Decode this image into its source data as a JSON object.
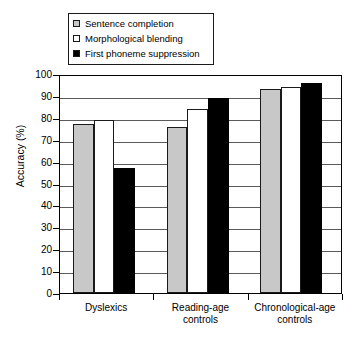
{
  "chart_data": {
    "type": "bar",
    "title": "",
    "xlabel": "",
    "ylabel": "Accuracy (%)",
    "ylim": [
      0,
      100
    ],
    "ytick_step": 10,
    "yticks": [
      "100",
      "90",
      "80",
      "70",
      "60",
      "50",
      "40",
      "30",
      "20",
      "10",
      "0"
    ],
    "grid": "horizontal",
    "legend_position": "above-plot-left",
    "categories": [
      "Dyslexics",
      "Reading-age controls",
      "Chronological-age controls"
    ],
    "category_lines": [
      [
        "Dyslexics"
      ],
      [
        "Reading-age",
        "controls"
      ],
      [
        "Chronological-age",
        "controls"
      ]
    ],
    "series": [
      {
        "name": "Sentence completion",
        "color": "#c8c8c8",
        "swatch": "sw-gray",
        "values": [
          77,
          76,
          93
        ]
      },
      {
        "name": "Morphological blending",
        "color": "#ffffff",
        "swatch": "sw-white",
        "values": [
          79,
          84,
          94
        ]
      },
      {
        "name": "First phoneme suppression",
        "color": "#000000",
        "swatch": "sw-black",
        "values": [
          57,
          89,
          96
        ]
      }
    ]
  }
}
